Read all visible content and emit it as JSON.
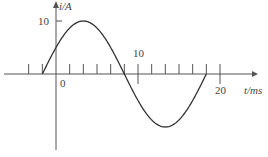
{
  "chart_data": {
    "type": "line",
    "title": "",
    "xlabel": "t/ms",
    "ylabel": "i/A",
    "x_tick_labels": [
      "0",
      "10",
      "20"
    ],
    "y_tick_labels": [
      "10"
    ],
    "xlim": [
      -6.67,
      25
    ],
    "ylim": [
      -12,
      12
    ],
    "grid": false,
    "legend": null,
    "series": [
      {
        "name": "i(t)",
        "description": "sinusoid, amplitude 10 A, period 20 ms, zero crossing at t = -1.67 ms (phase +30°)",
        "amplitude": 10,
        "period_ms": 20,
        "phase_deg": 30,
        "x": [
          -1.67,
          0,
          3.33,
          8.33,
          13.33,
          18.33
        ],
        "values": [
          0,
          5,
          10,
          0,
          -10,
          0
        ]
      }
    ],
    "annotations": []
  },
  "labels": {
    "y_axis": "i/A",
    "x_axis": "t/ms",
    "y_ten": "10",
    "origin": "0",
    "x_ten": "10",
    "x_twenty": "20"
  },
  "colors": {
    "axis": "#555555",
    "curve": "#333333"
  }
}
